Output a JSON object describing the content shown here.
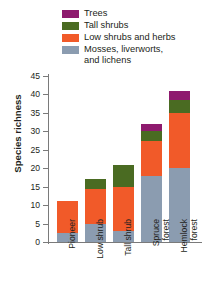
{
  "chart_data": {
    "type": "bar",
    "stacked": true,
    "title": "",
    "xlabel": "",
    "ylabel": "Species richness",
    "ylim": [
      0,
      45
    ],
    "ytick_step": 5,
    "yticks": [
      0,
      5,
      10,
      15,
      20,
      25,
      30,
      35,
      40,
      45
    ],
    "grid": false,
    "legend_position": "top-right",
    "categories": [
      "Pioneer",
      "Low shrub",
      "Tall shrub",
      "Spruce forest",
      "Hemlock forest"
    ],
    "series": [
      {
        "name": "Mosses, liverworts, and lichens",
        "color": "#8b9cb0",
        "values": [
          2.5,
          5,
          3,
          18,
          20
        ]
      },
      {
        "name": "Low shrubs and herbs",
        "color": "#f15a29",
        "values": [
          8.5,
          9.5,
          12,
          9.5,
          15
        ]
      },
      {
        "name": "Tall shrubs",
        "color": "#4a6b22",
        "values": [
          0,
          2.5,
          6,
          2.5,
          3.5
        ]
      },
      {
        "name": "Trees",
        "color": "#8e1a6e",
        "values": [
          0,
          0,
          0,
          2,
          2.5
        ]
      }
    ],
    "totals": [
      11,
      17,
      21,
      32,
      41
    ]
  },
  "legend": {
    "items": [
      {
        "label": "Trees",
        "color": "#8e1a6e"
      },
      {
        "label": "Tall shrubs",
        "color": "#4a6b22"
      },
      {
        "label": "Low shrubs and herbs",
        "color": "#f15a29"
      },
      {
        "label": "Mosses, liverworts,\nand lichens",
        "color": "#8b9cb0"
      }
    ]
  },
  "axis": {
    "y_title": "Species richness",
    "y_ticks": [
      "45",
      "40",
      "35",
      "30",
      "25",
      "20",
      "15",
      "10",
      "5",
      "0"
    ],
    "x_ticks": [
      "Pioneer",
      "Low shrub",
      "Tall shrub",
      "Spruce\nforest",
      "Hemlock\nforest"
    ]
  }
}
